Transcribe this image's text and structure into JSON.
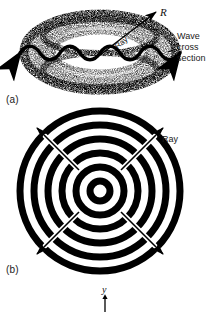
{
  "figure": {
    "background_color": "#ffffff",
    "ink_color": "#000000",
    "panels": [
      {
        "id": "a",
        "label": "(a)",
        "caption_text": "Wave cross section",
        "annotations": {
          "radius_symbol": "R",
          "ray_label": "Ray"
        },
        "description": "Stippled three-dimensional spherical wave shell shown as a torus/ellipsoid with a sinusoidal wave cross-section line drawn through it, double-headed; an outward radial ray arrow labelled R emerges at the upper right.",
        "geometry": {
          "center_x": 100,
          "center_y": 52,
          "outer_rx": 78,
          "outer_ry": 40,
          "inner_rx": 46,
          "inner_ry": 19,
          "wave_cycles": 6,
          "wave_amplitude": 5,
          "wave_baseline_y": 53,
          "wave_x_start": 12,
          "wave_x_end": 188,
          "ray_arrow": {
            "x1": 100,
            "y1": 54,
            "x2": 157,
            "y2": 11
          }
        }
      },
      {
        "id": "b",
        "label": "(b)",
        "annotations": {
          "ray_label": "Ray"
        },
        "description": "Plan view of the same spherical wave: five heavy concentric black rings (wavefronts) with four diagonal ray arrows radiating outward from the common centre.",
        "geometry": {
          "center_x": 100,
          "center_y": 191,
          "ring_radii": [
            10,
            24,
            38,
            52,
            66,
            80
          ],
          "ring_stroke_width": 7,
          "ray_arrow_angles_deg": [
            225,
            315,
            45,
            135
          ],
          "ray_arrow_inner_radius": 30,
          "ray_arrow_outer_radius": 92
        }
      }
    ],
    "next_figure_hint": {
      "axis_symbol": "y",
      "arrow_direction": "down",
      "x": 105,
      "y": 292
    }
  }
}
